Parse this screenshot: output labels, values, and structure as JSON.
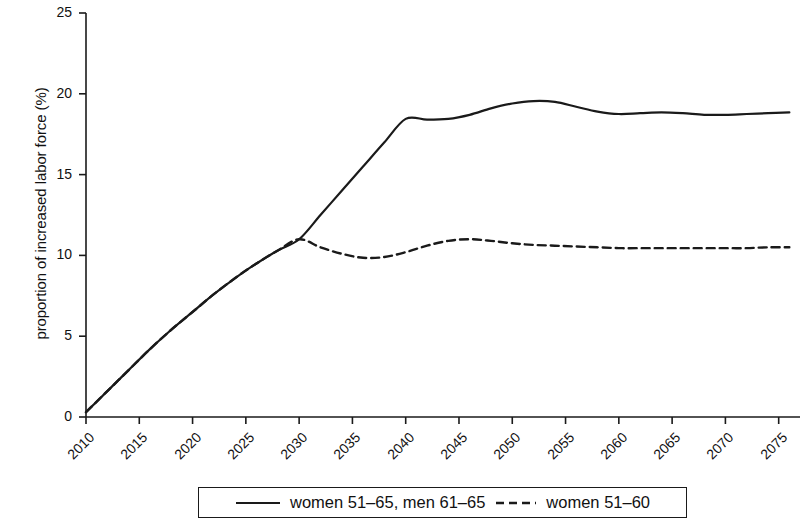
{
  "chart_data": {
    "type": "line",
    "title": "",
    "xlabel": "",
    "ylabel": "proportion of increased labor force (%)",
    "xlim": [
      2010,
      2077
    ],
    "ylim": [
      0,
      25
    ],
    "yticks": [
      0,
      5,
      10,
      15,
      20,
      25
    ],
    "xticks": [
      2010,
      2015,
      2020,
      2025,
      2030,
      2035,
      2040,
      2045,
      2050,
      2055,
      2060,
      2065,
      2070,
      2075
    ],
    "grid": false,
    "legend_position": "bottom",
    "x": [
      2010,
      2012,
      2014,
      2016,
      2018,
      2020,
      2022,
      2024,
      2026,
      2028,
      2030,
      2032,
      2034,
      2036,
      2038,
      2040,
      2042,
      2044,
      2046,
      2048,
      2050,
      2052,
      2054,
      2056,
      2058,
      2060,
      2062,
      2064,
      2066,
      2068,
      2070,
      2072,
      2074,
      2076
    ],
    "series": [
      {
        "name": "women 51-65, men 61-65",
        "style": "solid",
        "color": "#1a1a1a",
        "values": [
          0.3,
          1.6,
          2.9,
          4.2,
          5.4,
          6.5,
          7.6,
          8.6,
          9.5,
          10.3,
          11.0,
          12.5,
          14.0,
          15.5,
          17.0,
          18.45,
          18.4,
          18.45,
          18.7,
          19.1,
          19.4,
          19.55,
          19.5,
          19.2,
          18.9,
          18.75,
          18.8,
          18.85,
          18.8,
          18.7,
          18.7,
          18.75,
          18.8,
          18.85
        ]
      },
      {
        "name": "women 51-60",
        "style": "dashed",
        "color": "#1a1a1a",
        "values": [
          0.3,
          1.6,
          2.9,
          4.2,
          5.4,
          6.5,
          7.6,
          8.6,
          9.5,
          10.3,
          11.0,
          10.5,
          10.1,
          9.85,
          9.9,
          10.2,
          10.6,
          10.9,
          11.0,
          10.9,
          10.75,
          10.65,
          10.6,
          10.55,
          10.5,
          10.45,
          10.45,
          10.45,
          10.45,
          10.45,
          10.45,
          10.45,
          10.5,
          10.5
        ]
      }
    ]
  },
  "legend": {
    "entries": [
      {
        "label": "women 51–65, men 61–65",
        "style": "solid"
      },
      {
        "label": "women 51–60",
        "style": "dashed"
      }
    ]
  },
  "axes": {
    "y_title": "proportion of increased labor force (%)",
    "y_tick_labels": [
      "0",
      "5",
      "10",
      "15",
      "20",
      "25"
    ],
    "x_tick_labels": [
      "2010",
      "2015",
      "2020",
      "2025",
      "2030",
      "2035",
      "2040",
      "2045",
      "2050",
      "2055",
      "2060",
      "2065",
      "2070",
      "2075"
    ]
  }
}
